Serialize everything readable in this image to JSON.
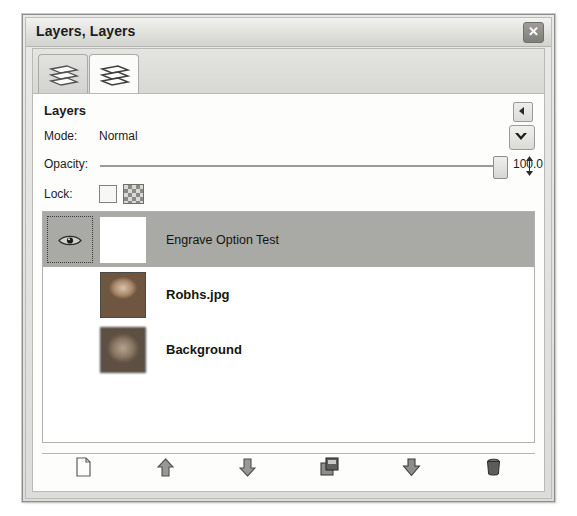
{
  "window": {
    "title": "Layers, Layers",
    "close_label": "✕"
  },
  "tabs": [
    {
      "name": "layers-tab-1",
      "icon": "layers-stack-icon",
      "active": false
    },
    {
      "name": "layers-tab-2",
      "icon": "layers-stack-icon",
      "active": true
    }
  ],
  "panel": {
    "title": "Layers",
    "collapse_icon": "triangle-left-icon",
    "menu_icon": "chevron-down-icon"
  },
  "mode": {
    "label": "Mode:",
    "value": "Normal"
  },
  "opacity": {
    "label": "Opacity:",
    "value": "100.0",
    "percent": 100
  },
  "lock": {
    "label": "Lock:",
    "alpha_checkbox_checked": false,
    "alpha_swatch_icon": "checkerboard-icon"
  },
  "layers": [
    {
      "name": "Engrave Option Test",
      "visible": true,
      "selected": true,
      "thumb": "white",
      "bold": false
    },
    {
      "name": "Robhs.jpg",
      "visible": false,
      "selected": false,
      "thumb": "portrait",
      "bold": true
    },
    {
      "name": "Background",
      "visible": false,
      "selected": false,
      "thumb": "blurred",
      "bold": true
    }
  ],
  "toolbar": [
    {
      "name": "new-layer-button",
      "icon": "document-icon"
    },
    {
      "name": "raise-layer-button",
      "icon": "arrow-up-icon"
    },
    {
      "name": "lower-layer-button",
      "icon": "arrow-down-icon"
    },
    {
      "name": "duplicate-layer-button",
      "icon": "duplicate-icon"
    },
    {
      "name": "anchor-layer-button",
      "icon": "anchor-icon"
    },
    {
      "name": "delete-layer-button",
      "icon": "trash-icon"
    }
  ],
  "colors": {
    "selection": "#a9a9a6",
    "frame": "#8e8e8c",
    "text": "#1c1c1c"
  }
}
